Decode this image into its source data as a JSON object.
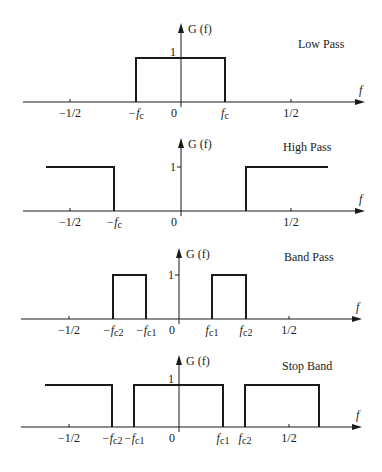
{
  "figure": {
    "y_label": "G (f)",
    "x_label": "f",
    "unit_level_label": "1",
    "zero_label": "0",
    "colors": {
      "ink": "#1a1a1a",
      "background": "#ffffff"
    }
  },
  "panels": [
    {
      "title": "Low Pass",
      "axis_y": 102,
      "top_y": 23,
      "level_y": 58,
      "origin_x": 181,
      "axis_x0": 23,
      "axis_x1": 365,
      "ticks": [
        {
          "x": 70,
          "label": "−1/2"
        },
        {
          "x": 291,
          "label": "1/2"
        }
      ],
      "cutoff_labels": [
        {
          "x": 136,
          "label": "−f",
          "sub": "c"
        },
        {
          "x": 225,
          "label": "f",
          "sub": "c"
        }
      ],
      "title_x": 298,
      "title_y": 48,
      "unit_tick": false,
      "segments": [
        [
          136,
          225
        ]
      ]
    },
    {
      "title": "High Pass",
      "axis_y": 211,
      "top_y": 138,
      "level_y": 167,
      "origin_x": 181,
      "axis_x0": 23,
      "axis_x1": 365,
      "ticks": [
        {
          "x": 70,
          "label": "−1/2"
        },
        {
          "x": 291,
          "label": "1/2"
        }
      ],
      "cutoff_labels": [
        {
          "x": 114,
          "label": "−f",
          "sub": "c"
        }
      ],
      "title_x": 283,
      "title_y": 151,
      "unit_tick": true,
      "segments": [
        [
          46,
          114
        ],
        [
          246,
          328
        ]
      ]
    },
    {
      "title": "Band Pass",
      "axis_y": 319,
      "top_y": 248,
      "level_y": 275,
      "origin_x": 179,
      "axis_x0": 21,
      "axis_x1": 362,
      "ticks": [
        {
          "x": 69,
          "label": "−1/2"
        },
        {
          "x": 289,
          "label": "1/2"
        }
      ],
      "cutoff_labels": [
        {
          "x": 113,
          "label": "−f",
          "sub": "c2"
        },
        {
          "x": 146,
          "label": "−f",
          "sub": "c1"
        },
        {
          "x": 212,
          "label": "f",
          "sub": "c1"
        },
        {
          "x": 246,
          "label": "f",
          "sub": "c2"
        }
      ],
      "title_x": 284,
      "title_y": 261,
      "unit_tick": true,
      "segments": [
        [
          113,
          146
        ],
        [
          212,
          246
        ]
      ]
    },
    {
      "title": "Stop Band",
      "axis_y": 427,
      "top_y": 355,
      "level_y": 385,
      "origin_x": 179,
      "axis_x0": 21,
      "axis_x1": 362,
      "ticks": [
        {
          "x": 69,
          "label": "−1/2"
        },
        {
          "x": 289,
          "label": "1/2"
        }
      ],
      "cutoff_labels": [
        {
          "x": 112,
          "label": "−f",
          "sub": "c2"
        },
        {
          "x": 134,
          "label": "−f",
          "sub": "c1"
        },
        {
          "x": 223,
          "label": "f",
          "sub": "c1"
        },
        {
          "x": 245,
          "label": "f",
          "sub": "c2"
        }
      ],
      "title_x": 282,
      "title_y": 370,
      "unit_tick": false,
      "segments": [
        [
          45,
          112
        ],
        [
          134,
          223
        ],
        [
          245,
          319
        ]
      ]
    }
  ]
}
